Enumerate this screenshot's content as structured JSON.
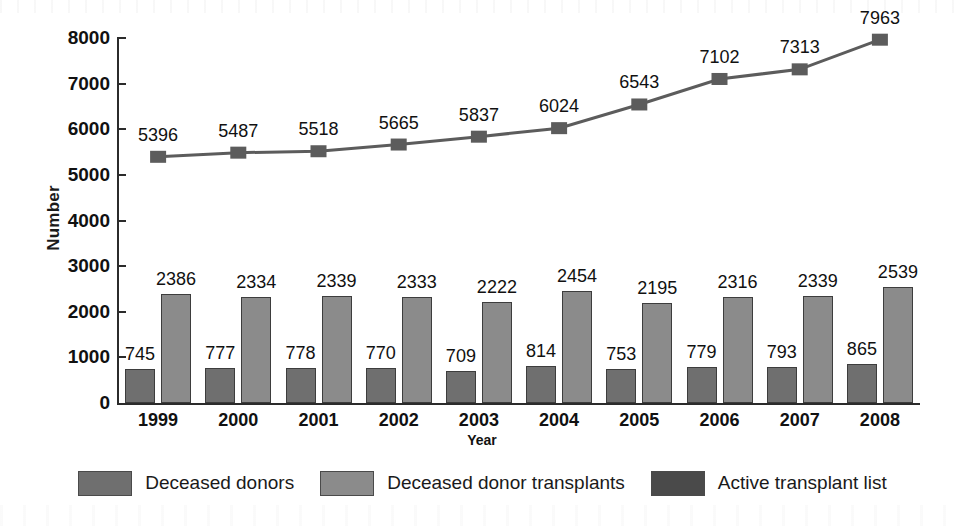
{
  "chart_data": {
    "type": "bar",
    "title": "",
    "xlabel": "Year",
    "ylabel": "Number",
    "ylim": [
      0,
      8000
    ],
    "ytick_labels": [
      "0",
      "1000",
      "2000",
      "3000",
      "4000",
      "5000",
      "6000",
      "7000",
      "8000"
    ],
    "ytick_values": [
      0,
      1000,
      2000,
      3000,
      4000,
      5000,
      6000,
      7000,
      8000
    ],
    "grid": false,
    "legend_position": "bottom",
    "categories": [
      "1999",
      "2000",
      "2001",
      "2002",
      "2003",
      "2004",
      "2005",
      "2006",
      "2007",
      "2008"
    ],
    "series": [
      {
        "name": "Deceased donors",
        "render": "bar",
        "color": "#6f6f6f",
        "values": [
          745,
          777,
          778,
          770,
          709,
          814,
          753,
          779,
          793,
          865
        ]
      },
      {
        "name": "Deceased donor transplants",
        "render": "bar",
        "color": "#8b8b8b",
        "values": [
          2386,
          2334,
          2339,
          2333,
          2222,
          2454,
          2195,
          2316,
          2339,
          2539
        ]
      },
      {
        "name": "Active transplant list",
        "render": "line",
        "color": "#5c5c5c",
        "values": [
          5396,
          5487,
          5518,
          5665,
          5837,
          6024,
          6543,
          7102,
          7313,
          7963
        ]
      }
    ]
  },
  "legend": {
    "items": [
      {
        "label": "Deceased donors",
        "color": "#6f6f6f"
      },
      {
        "label": "Deceased donor transplants",
        "color": "#8b8b8b"
      },
      {
        "label": "Active transplant list",
        "color": "#4a4a4a"
      }
    ]
  }
}
